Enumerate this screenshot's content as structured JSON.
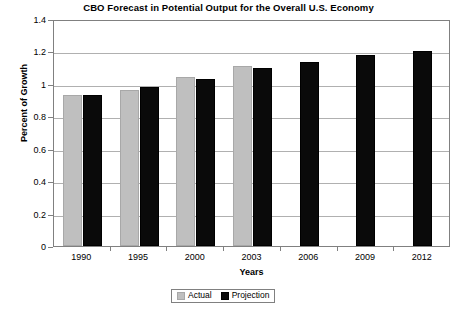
{
  "chart_data": {
    "type": "bar",
    "title": "CBO Forecast in Potential Output for the Overall U.S. Economy",
    "xlabel": "Years",
    "ylabel": "Percent of Growth",
    "categories": [
      "1990",
      "1995",
      "2000",
      "2003",
      "2006",
      "2009",
      "2012"
    ],
    "series": [
      {
        "name": "Actual",
        "color": "#bfbfbf",
        "values": [
          0.93,
          0.96,
          1.04,
          1.11,
          null,
          null,
          null
        ]
      },
      {
        "name": "Projection",
        "color": "#0a0a0a",
        "values": [
          0.93,
          0.98,
          1.03,
          1.1,
          1.135,
          1.175,
          1.205
        ]
      }
    ],
    "ylim": [
      0,
      1.4
    ],
    "ytick_labels": [
      "0",
      "0.2",
      "0.4",
      "0.6",
      "0.8",
      "1",
      "1.2",
      "1.4"
    ],
    "ytick_values": [
      0,
      0.2,
      0.4,
      0.6,
      0.8,
      1.0,
      1.2,
      1.4
    ],
    "grid": true,
    "legend_position": "bottom-center"
  },
  "legend": {
    "entries": [
      {
        "label": "Actual"
      },
      {
        "label": "Projection"
      }
    ]
  }
}
